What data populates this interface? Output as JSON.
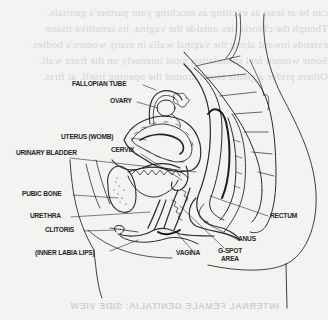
{
  "figure": {
    "type": "anatomical line drawing",
    "view": "side (sagittal) view",
    "caption_bleed_through": "INTERNAL FEMALE GENITALIA: SIDE VIEW"
  },
  "labels": {
    "fallopian_tube": "FALLOPIAN TUBE",
    "ovary": "OVARY",
    "uterus": "UTERUS (WOMB)",
    "cervix": "CERVIX",
    "urinary_bladder": "URINARY BLADDER",
    "pubic_bone": "PUBIC BONE",
    "urethra": "URETHRA",
    "clitoris": "CLITORIS",
    "inner_labia": "(INNER LABIA LIPS)",
    "rectum": "RECTUM",
    "anus": "ANUS",
    "vagina": "VAGINA",
    "gspot_line1": "G-SPOT",
    "gspot_line2": "AREA"
  },
  "colors": {
    "ink": "#262626",
    "paper": "#f3f3f1",
    "bleed_through": "#d6d6d4"
  }
}
